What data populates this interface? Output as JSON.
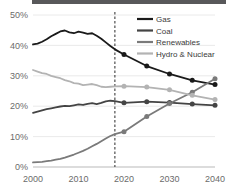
{
  "chart_data": {
    "type": "line",
    "title": "",
    "subtitle": "",
    "xlabel": "",
    "ylabel": "",
    "xlim": [
      2000,
      2040
    ],
    "ylim": [
      0,
      0.5
    ],
    "ytick_labels": [
      "0%",
      "10%",
      "20%",
      "30%",
      "40%",
      "50%"
    ],
    "ytick_values": [
      0,
      10,
      20,
      30,
      40,
      50
    ],
    "xtick_labels": [
      "2000",
      "2010",
      "2020",
      "2030",
      "2040"
    ],
    "xtick_values": [
      2000,
      2010,
      2020,
      2030,
      2040
    ],
    "grid": true,
    "legend_position": "top-right",
    "annotations": [
      {
        "name": "projection-divider",
        "type": "vline",
        "x": 2018,
        "style": "dashed",
        "label": ""
      }
    ],
    "marker_years": [
      2020,
      2025,
      2030,
      2035,
      2040
    ],
    "series": [
      {
        "name": "Gas",
        "color": "#1a1a1a",
        "x": [
          2000,
          2001,
          2002,
          2003,
          2004,
          2005,
          2006,
          2007,
          2008,
          2009,
          2010,
          2011,
          2012,
          2013,
          2014,
          2015,
          2016,
          2017,
          2018,
          2020,
          2025,
          2030,
          2035,
          2040
        ],
        "values": [
          40.3,
          40.6,
          41.2,
          42.0,
          43.0,
          43.8,
          44.6,
          44.9,
          44.3,
          44.0,
          44.5,
          44.2,
          43.8,
          44.0,
          43.2,
          42.2,
          41.0,
          39.8,
          38.7,
          37.0,
          33.2,
          30.6,
          28.5,
          27.1
        ]
      },
      {
        "name": "Coal",
        "color": "#444444",
        "x": [
          2000,
          2001,
          2002,
          2003,
          2004,
          2005,
          2006,
          2007,
          2008,
          2009,
          2010,
          2011,
          2012,
          2013,
          2014,
          2015,
          2016,
          2017,
          2018,
          2020,
          2025,
          2030,
          2035,
          2040
        ],
        "values": [
          17.8,
          18.2,
          18.6,
          19.0,
          19.3,
          19.6,
          19.9,
          20.1,
          20.0,
          20.3,
          20.6,
          20.4,
          20.8,
          21.0,
          20.7,
          21.1,
          21.6,
          21.8,
          21.7,
          21.1,
          21.5,
          21.2,
          20.7,
          20.3
        ]
      },
      {
        "name": "Renewables",
        "color": "#7a7a7a",
        "x": [
          2000,
          2001,
          2002,
          2003,
          2004,
          2005,
          2006,
          2007,
          2008,
          2009,
          2010,
          2011,
          2012,
          2013,
          2014,
          2015,
          2016,
          2017,
          2018,
          2020,
          2025,
          2030,
          2035,
          2040
        ],
        "values": [
          1.5,
          1.6,
          1.7,
          1.9,
          2.1,
          2.4,
          2.7,
          3.1,
          3.6,
          4.1,
          4.7,
          5.3,
          6.0,
          6.8,
          7.6,
          8.5,
          9.4,
          10.2,
          10.8,
          11.6,
          16.6,
          20.9,
          24.6,
          29.0
        ]
      },
      {
        "name": "Hydro & Nuclear",
        "color": "#b3b3b3",
        "x": [
          2000,
          2001,
          2002,
          2003,
          2004,
          2005,
          2006,
          2007,
          2008,
          2009,
          2010,
          2011,
          2012,
          2013,
          2014,
          2015,
          2016,
          2017,
          2018,
          2020,
          2025,
          2030,
          2035,
          2040
        ],
        "values": [
          31.9,
          31.4,
          30.9,
          30.6,
          30.0,
          29.6,
          29.2,
          28.6,
          28.2,
          27.6,
          27.4,
          26.9,
          27.1,
          27.3,
          26.9,
          26.4,
          26.3,
          26.4,
          26.5,
          26.6,
          26.3,
          25.4,
          23.6,
          22.2
        ]
      }
    ]
  },
  "legend": {
    "items": [
      {
        "label": "Gas",
        "color": "#1a1a1a"
      },
      {
        "label": "Coal",
        "color": "#444444"
      },
      {
        "label": "Renewables",
        "color": "#7a7a7a"
      },
      {
        "label": "Hydro & Nuclear",
        "color": "#b3b3b3"
      }
    ]
  }
}
